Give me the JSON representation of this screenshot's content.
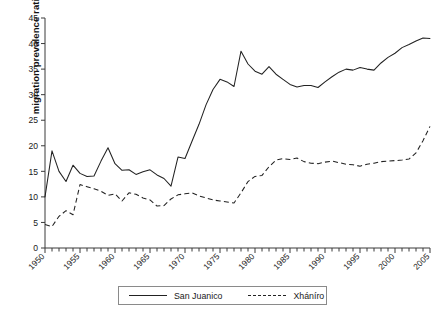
{
  "chart_data": {
    "type": "line",
    "title": "",
    "xlabel": "",
    "ylabel": "migration prevalence ratio",
    "xlim": [
      1950,
      2005
    ],
    "ylim": [
      0,
      45
    ],
    "ytick_step": 5,
    "yticks": [
      "0",
      "5",
      "10",
      "15",
      "20",
      "25",
      "30",
      "35",
      "40",
      "45"
    ],
    "xticks": [
      "1950",
      "1955",
      "1960",
      "1965",
      "1970",
      "1975",
      "1980",
      "1985",
      "1990",
      "1995",
      "2000",
      "2005"
    ],
    "xtick_step": 5,
    "minor_xticks_every": 1,
    "grid": false,
    "legend_position": "bottom-center",
    "x": [
      1950,
      1951,
      1952,
      1953,
      1954,
      1955,
      1956,
      1957,
      1958,
      1959,
      1960,
      1961,
      1962,
      1963,
      1964,
      1965,
      1966,
      1967,
      1968,
      1969,
      1970,
      1971,
      1972,
      1973,
      1974,
      1975,
      1976,
      1977,
      1978,
      1979,
      1980,
      1981,
      1982,
      1983,
      1984,
      1985,
      1986,
      1987,
      1988,
      1989,
      1990,
      1991,
      1992,
      1993,
      1994,
      1995,
      1996,
      1997,
      1998,
      1999,
      2000,
      2001,
      2002,
      2003,
      2004,
      2005
    ],
    "series": [
      {
        "name": "San Juanico",
        "style": "solid",
        "color": "#222222",
        "values": [
          10.0,
          19.0,
          15.0,
          13.0,
          16.2,
          14.6,
          14.0,
          14.1,
          17.0,
          19.6,
          16.5,
          15.2,
          15.3,
          14.4,
          14.9,
          15.3,
          14.3,
          13.6,
          12.1,
          17.8,
          17.5,
          20.9,
          24.2,
          28.0,
          31.0,
          33.0,
          32.5,
          31.6,
          38.5,
          36.0,
          34.6,
          34.0,
          35.5,
          34.0,
          33.0,
          32.0,
          31.5,
          31.8,
          31.8,
          31.4,
          32.5,
          33.5,
          34.4,
          35.0,
          34.8,
          35.3,
          35.0,
          34.8,
          36.2,
          37.3,
          38.1,
          39.2,
          39.8,
          40.5,
          41.1,
          41.0
        ]
      },
      {
        "name": "Xháníro",
        "style": "dashed",
        "color": "#222222",
        "values": [
          4.6,
          4.2,
          6.2,
          7.3,
          6.5,
          12.4,
          12.0,
          11.6,
          11.1,
          10.3,
          10.6,
          9.2,
          10.8,
          10.5,
          9.8,
          9.4,
          8.2,
          8.3,
          9.6,
          10.4,
          10.6,
          10.8,
          10.2,
          9.8,
          9.4,
          9.2,
          9.0,
          8.8,
          10.8,
          13.0,
          14.0,
          14.2,
          15.9,
          17.2,
          17.5,
          17.3,
          17.6,
          16.9,
          16.6,
          16.5,
          16.8,
          17.0,
          16.7,
          16.4,
          16.3,
          16.0,
          16.4,
          16.6,
          16.9,
          17.0,
          17.1,
          17.2,
          17.4,
          18.6,
          21.0,
          23.8
        ]
      }
    ]
  },
  "legend": {
    "items": [
      {
        "label": "San Juanico",
        "style": "solid"
      },
      {
        "label": "Xháníro",
        "style": "dashed"
      }
    ]
  }
}
